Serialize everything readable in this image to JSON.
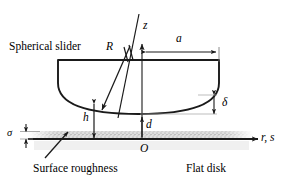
{
  "figure": {
    "type": "technical-diagram",
    "background_color": "#ffffff",
    "line_color": "#1a1a1a",
    "roughness_fill": "#d9d9d9"
  },
  "labels": {
    "spherical_slider": "Spherical slider",
    "flat_disk": "Flat disk",
    "surface_roughness": "Surface roughness",
    "radius": "R",
    "z_axis": "z",
    "contact_radius": "a",
    "delta": "δ",
    "film_thickness": "h",
    "separation": "d",
    "sigma": "σ",
    "origin": "O",
    "radial_axis": "r, s"
  },
  "geometry": {
    "axis_baseline_y": 139,
    "axis_origin_x": 142,
    "slider_top_y": 60,
    "slider_left_x": 58,
    "slider_right_x": 219,
    "sphere_bottom_y": 114,
    "z_axis_top_y": 46,
    "dimension_a_y": 49,
    "delta_top_y": 95,
    "delta_bottom_y": 114
  }
}
